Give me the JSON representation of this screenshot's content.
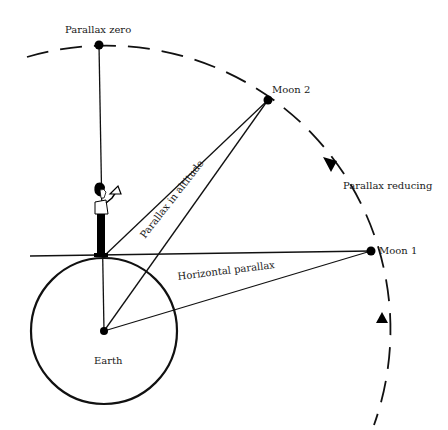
{
  "diagram": {
    "labels": {
      "parallax_zero": "Parallax zero",
      "moon2": "Moon 2",
      "moon1": "Moon 1",
      "parallax_reducing": "Parallax reducing",
      "parallax_in_altitude": "Parallax in altitude",
      "horizontal_parallax": "Horizontal parallax",
      "earth": "Earth"
    },
    "points": {
      "earth_center": [
        104,
        331
      ],
      "earth_radius": 73,
      "observer": [
        103,
        257
      ],
      "parallax_zero": [
        99,
        45
      ],
      "moon2": [
        268,
        100
      ],
      "moon1": [
        371,
        251
      ]
    },
    "colors": {
      "ink": "#111111",
      "background": "#ffffff"
    }
  }
}
